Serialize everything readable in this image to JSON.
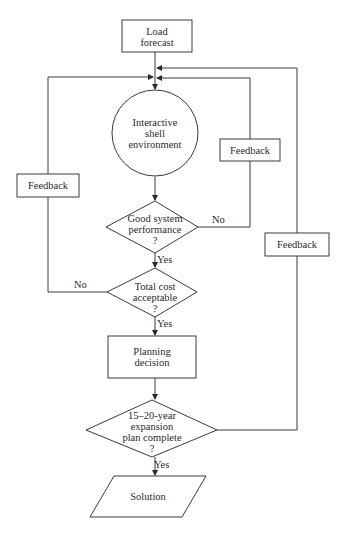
{
  "nodes": {
    "load_forecast": {
      "line1": "Load",
      "line2": "forecast"
    },
    "shell": {
      "line1": "Interactive",
      "line2": "shell",
      "line3": "environment"
    },
    "perf": {
      "line1": "Good system",
      "line2": "performance",
      "line3": "?"
    },
    "cost": {
      "line1": "Total cost",
      "line2": "acceptable",
      "line3": "?"
    },
    "planning": {
      "line1": "Planning",
      "line2": "decision"
    },
    "expansion": {
      "line1": "15–20-year",
      "line2": "expansion",
      "line3": "plan complete",
      "line4": "?"
    },
    "solution": {
      "label": "Solution"
    }
  },
  "feedback": {
    "left": "Feedback",
    "inner_right": "Feedback",
    "outer_right": "Feedback"
  },
  "edges": {
    "perf_yes": "Yes",
    "perf_no": "No",
    "cost_yes": "Yes",
    "cost_no": "No",
    "expansion_yes": "Yes"
  }
}
